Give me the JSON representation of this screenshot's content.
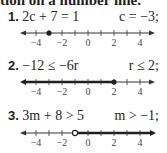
{
  "heading": "tion on a number line.",
  "problems": [
    {
      "number": "1.",
      "equation": "2c + 7 = 1",
      "answer": "c = −3;",
      "number_line": {
        "ticks": [
          -4,
          -3,
          -2,
          -1,
          0,
          1,
          2,
          3,
          4
        ],
        "labels": [
          "−4",
          "−2",
          "0",
          "2",
          "4"
        ],
        "graph": "closed-point",
        "point": -3
      }
    },
    {
      "number": "2.",
      "equation": "−12 ≤ −6r",
      "answer": "r ≤ 2;",
      "number_line": {
        "ticks": [
          -4,
          -3,
          -2,
          -1,
          0,
          1,
          2,
          3,
          4
        ],
        "labels": [
          "−4",
          "−2",
          "0",
          "2",
          "4"
        ],
        "graph": "closed-ray-left",
        "point": 2
      }
    },
    {
      "number": "3.",
      "equation": "3m + 8 > 5",
      "answer": "m > −1;",
      "number_line": {
        "ticks": [
          -4,
          -3,
          -2,
          -1,
          0,
          1,
          2,
          3,
          4
        ],
        "labels": [
          "−4",
          "−2",
          "0",
          "2",
          "4"
        ],
        "graph": "open-ray-right",
        "point": -1
      }
    }
  ]
}
